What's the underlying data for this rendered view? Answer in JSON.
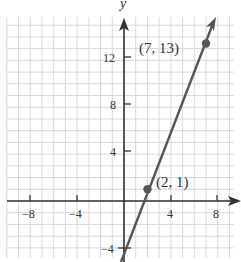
{
  "chart_data": {
    "type": "line",
    "title": "",
    "xlabel": "",
    "ylabel": "y",
    "xlim": [
      -10,
      9.5
    ],
    "ylim": [
      -4.7,
      15.5
    ],
    "grid": true,
    "grid_step": 1,
    "x_ticks": [
      -8,
      -4,
      4,
      8
    ],
    "y_ticks": [
      -4,
      4,
      8,
      12
    ],
    "x_tick_labels": [
      "−8",
      "−4",
      "4",
      "8"
    ],
    "y_tick_labels": [
      "−4",
      "4",
      "8",
      "12"
    ],
    "series": [
      {
        "name": "line through (2, 1) and (7, 13)",
        "slope": 2.4,
        "intercept": -3.8,
        "x": [
          -0.3,
          7.7
        ],
        "y": [
          -4.52,
          14.68
        ],
        "color": "#555555"
      }
    ],
    "points": [
      {
        "x": 2,
        "y": 1,
        "label": "(2, 1)"
      },
      {
        "x": 7,
        "y": 13,
        "label": "(7, 13)"
      }
    ],
    "legend": null
  },
  "labels": {
    "y_axis": "y",
    "point_a": "(2, 1)",
    "point_b": "(7, 13)",
    "xt_m8": "−8",
    "xt_m4": "−4",
    "xt_4": "4",
    "xt_8": "8",
    "yt_m4": "−4",
    "yt_4": "4",
    "yt_8": "8",
    "yt_12": "12"
  },
  "colors": {
    "grid": "#d8d8d8",
    "axis": "#333333",
    "line": "#555555",
    "point": "#555555"
  }
}
